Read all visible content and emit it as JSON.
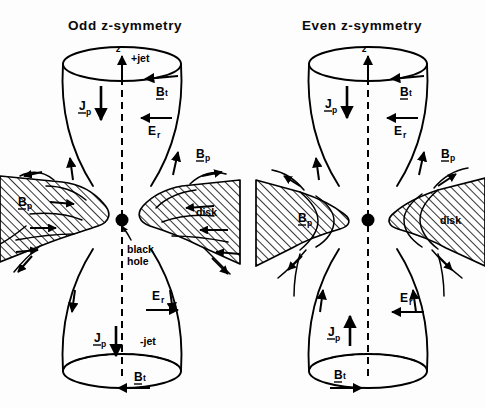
{
  "figure": {
    "background_color": "#fdfdfd",
    "ink_color": "#000000",
    "width": 485,
    "height": 408
  },
  "panels": [
    {
      "id": "odd",
      "title": "Odd z-symmetry",
      "axis_label": "z",
      "jet_top_label": "+jet",
      "jet_bottom_label": "-jet",
      "black_hole_label": "black\nhole",
      "black_hole_label_line1": "black",
      "black_hole_label_line2": "hole",
      "disk_label": "disk",
      "labels": {
        "bt_top": "B",
        "bt_top_sub": "t",
        "bt_bottom": "B",
        "bt_bottom_sub": "t",
        "jp_top": "J",
        "jp_top_sub": "p",
        "jp_bottom": "J",
        "jp_bottom_sub": "p",
        "er_top": "E",
        "er_top_sub": "r",
        "er_bottom": "E",
        "er_bottom_sub": "r",
        "bp_right": "B",
        "bp_right_sub": "p",
        "bp_disk_left": "B",
        "bp_disk_left_sub": "p"
      },
      "arrow_directions": {
        "z_axis": "up",
        "bt_top": "left",
        "bt_bottom": "left",
        "jp_top": "down",
        "jp_bottom": "down",
        "er_top": "left",
        "er_bottom": "right",
        "bp_upper_right": "up",
        "bp_upper_left": "up"
      }
    },
    {
      "id": "even",
      "title": "Even z-symmetry",
      "axis_label": "z",
      "jet_top_label": "",
      "jet_bottom_label": "",
      "black_hole_label": "",
      "disk_label": "disk",
      "labels": {
        "bt_top": "B",
        "bt_top_sub": "t",
        "bt_bottom": "B",
        "bt_bottom_sub": "t",
        "jp_top": "J",
        "jp_top_sub": "p",
        "jp_bottom": "J",
        "jp_bottom_sub": "p",
        "er_top": "E",
        "er_top_sub": "r",
        "er_bottom": "E",
        "er_bottom_sub": "r",
        "bp_right": "B",
        "bp_right_sub": "p",
        "bp_disk_left": "B",
        "bp_disk_left_sub": "p"
      },
      "arrow_directions": {
        "z_axis": "up",
        "bt_top": "left",
        "bt_bottom": "right",
        "jp_top": "down",
        "jp_bottom": "up",
        "er_top": "left",
        "er_bottom": "left",
        "bp_upper_right": "up",
        "bp_upper_left": "up"
      }
    }
  ]
}
